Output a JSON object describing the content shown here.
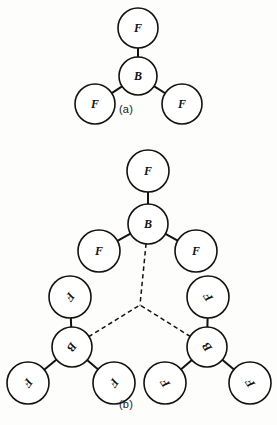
{
  "figure": {
    "background_color": "#fdfdfc",
    "stroke_color": "#14110f",
    "fill_color": "#ffffff",
    "width": 277,
    "height": 425,
    "captions": {
      "panel_a": "(a)",
      "panel_b": "(b)"
    }
  },
  "chart_data": {
    "type": "diagram",
    "title": "",
    "subtitle": "",
    "diagram_kind": "molecular-structure",
    "atom_labels": [
      "B",
      "F"
    ],
    "bond_styles": [
      "solid",
      "dashed"
    ],
    "panels": [
      {
        "id": "a",
        "caption": "(a)",
        "units": 1,
        "atoms": [
          {
            "id": "a-b1",
            "label": "B",
            "cx": 138,
            "cy": 76,
            "r": 19,
            "rotation": 0,
            "role": "center"
          },
          {
            "id": "a-f1",
            "label": "F",
            "cx": 138,
            "cy": 28,
            "r": 20,
            "rotation": 0,
            "role": "terminal"
          },
          {
            "id": "a-f2",
            "label": "F",
            "cx": 95,
            "cy": 104,
            "r": 20,
            "rotation": 0,
            "role": "terminal"
          },
          {
            "id": "a-f3",
            "label": "F",
            "cx": 182,
            "cy": 104,
            "r": 20,
            "rotation": 0,
            "role": "terminal"
          }
        ],
        "bonds": [
          {
            "from": "a-b1",
            "to": "a-f1",
            "style": "solid"
          },
          {
            "from": "a-b1",
            "to": "a-f2",
            "style": "solid"
          },
          {
            "from": "a-b1",
            "to": "a-f3",
            "style": "solid"
          }
        ]
      },
      {
        "id": "b",
        "caption": "(b)",
        "units": 3,
        "junction": {
          "cx": 140,
          "cy": 305
        },
        "atoms": [
          {
            "id": "b-t-b",
            "label": "B",
            "cx": 148,
            "cy": 224,
            "r": 20,
            "rotation": 0,
            "role": "center",
            "unit": "top"
          },
          {
            "id": "b-t-f1",
            "label": "F",
            "cx": 148,
            "cy": 171,
            "r": 21,
            "rotation": 0,
            "role": "terminal",
            "unit": "top"
          },
          {
            "id": "b-t-f2",
            "label": "F",
            "cx": 99,
            "cy": 251,
            "r": 21,
            "rotation": 0,
            "role": "terminal",
            "unit": "top"
          },
          {
            "id": "b-t-f3",
            "label": "F",
            "cx": 196,
            "cy": 251,
            "r": 21,
            "rotation": 0,
            "role": "terminal",
            "unit": "top"
          },
          {
            "id": "b-l-b",
            "label": "B",
            "cx": 72,
            "cy": 347,
            "r": 20,
            "rotation": 125,
            "role": "center",
            "unit": "left"
          },
          {
            "id": "b-l-f1",
            "label": "F",
            "cx": 70,
            "cy": 297,
            "r": 21,
            "rotation": 125,
            "role": "terminal",
            "unit": "left"
          },
          {
            "id": "b-l-f2",
            "label": "F",
            "cx": 28,
            "cy": 383,
            "r": 21,
            "rotation": 125,
            "role": "terminal",
            "unit": "left"
          },
          {
            "id": "b-l-f3",
            "label": "F",
            "cx": 114,
            "cy": 383,
            "r": 21,
            "rotation": 125,
            "role": "terminal",
            "unit": "left"
          },
          {
            "id": "b-r-b",
            "label": "B",
            "cx": 207,
            "cy": 347,
            "r": 20,
            "rotation": -125,
            "role": "center",
            "unit": "right"
          },
          {
            "id": "b-r-f1",
            "label": "F",
            "cx": 208,
            "cy": 297,
            "r": 21,
            "rotation": -125,
            "role": "terminal",
            "unit": "right"
          },
          {
            "id": "b-r-f2",
            "label": "F",
            "cx": 165,
            "cy": 383,
            "r": 21,
            "rotation": -125,
            "role": "terminal",
            "unit": "right"
          },
          {
            "id": "b-r-f3",
            "label": "F",
            "cx": 250,
            "cy": 383,
            "r": 21,
            "rotation": -125,
            "role": "terminal",
            "unit": "right"
          }
        ],
        "bonds": [
          {
            "from": "b-t-b",
            "to": "b-t-f1",
            "style": "solid"
          },
          {
            "from": "b-t-b",
            "to": "b-t-f2",
            "style": "solid"
          },
          {
            "from": "b-t-b",
            "to": "b-t-f3",
            "style": "solid"
          },
          {
            "from": "b-l-b",
            "to": "b-l-f1",
            "style": "solid"
          },
          {
            "from": "b-l-b",
            "to": "b-l-f2",
            "style": "solid"
          },
          {
            "from": "b-l-b",
            "to": "b-l-f3",
            "style": "solid"
          },
          {
            "from": "b-r-b",
            "to": "b-r-f1",
            "style": "solid"
          },
          {
            "from": "b-r-b",
            "to": "b-r-f2",
            "style": "solid"
          },
          {
            "from": "b-r-b",
            "to": "b-r-f3",
            "style": "solid"
          },
          {
            "from": "b-t-b",
            "to": "junction",
            "style": "dashed"
          },
          {
            "from": "b-l-b",
            "to": "junction",
            "style": "dashed"
          },
          {
            "from": "b-r-b",
            "to": "junction",
            "style": "dashed"
          }
        ]
      }
    ]
  }
}
